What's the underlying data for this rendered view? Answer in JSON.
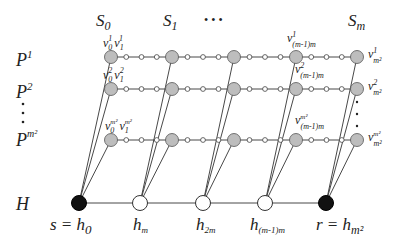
{
  "diagram": {
    "column_headers": [
      {
        "base": "S",
        "sub": "0",
        "x": 96,
        "y": 24
      },
      {
        "base": "S",
        "sub": "1",
        "x": 163,
        "y": 24
      },
      {
        "base": "S",
        "sub": "m",
        "x": 346,
        "y": 24
      }
    ],
    "column_ellipsis": "• • •",
    "row_labels": [
      {
        "base": "P",
        "sup": "1",
        "y": 60
      },
      {
        "base": "P",
        "sup": "2",
        "y": 92
      },
      {
        "base": "P",
        "sup": "m²",
        "y": 146
      }
    ],
    "row_ellipsis_dots": 3,
    "hub_row_label": "H",
    "columns_x": [
      111,
      172,
      234,
      296,
      357
    ],
    "rows_y": [
      57,
      89,
      140
    ],
    "h_row_y": 203,
    "h_nodes": [
      {
        "x": 79,
        "type": "black",
        "label": "s = h",
        "sub": "0"
      },
      {
        "x": 140,
        "type": "white",
        "label": "h",
        "sub": "m"
      },
      {
        "x": 203,
        "type": "white",
        "label": "h",
        "sub": "2m"
      },
      {
        "x": 265,
        "type": "white",
        "label": "h",
        "sub": "(m-1)m"
      },
      {
        "x": 326,
        "type": "black",
        "label": "r = h",
        "sub": "m²"
      }
    ],
    "node_labels": {
      "row1": [
        "v₀¹ v₁¹",
        "v¹₍ₘ₋₁₎ₘ",
        "v¹ₘ²"
      ],
      "row2": [
        "v₀² v₁²",
        "v²₍ₘ₋₁₎ₘ",
        "v²ₘ²"
      ],
      "row3": [
        "v₀ᵐ² v₁ᵐ²",
        "vᵐ²₍ₘ₋₁₎ₘ",
        "vᵐ²ₘ²"
      ]
    },
    "small_nodes_between": 3,
    "colors": {
      "gray_node": "#bdbdbd",
      "black_node": "#111111",
      "white_node": "#ffffff",
      "edge": "#333333"
    }
  }
}
